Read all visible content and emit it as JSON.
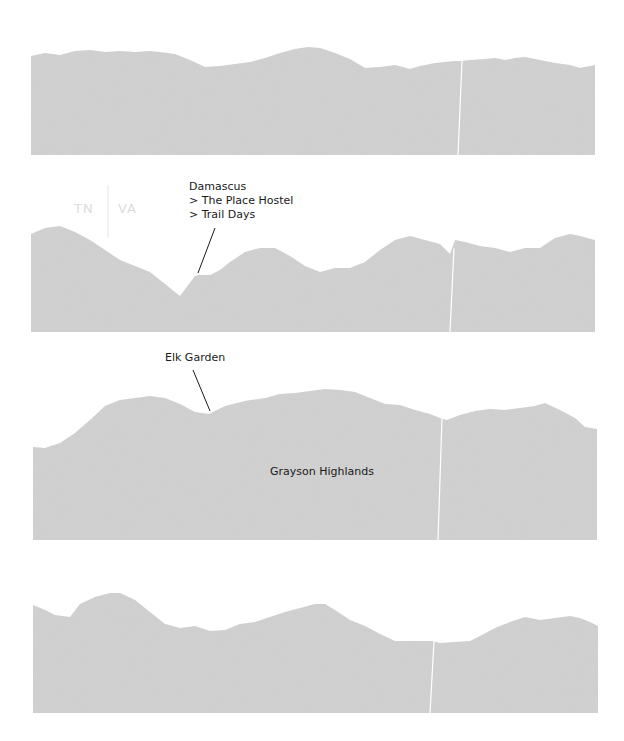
{
  "chart_data": {
    "type": "area",
    "title": "",
    "xlabel": "",
    "ylabel": "",
    "grid": false,
    "legend": null,
    "fill_color": "#cdcdcd",
    "panels": [
      {
        "id": "panel-1",
        "bounds": {
          "x0": 31,
          "x1": 595,
          "bottom": 155
        },
        "profile": [
          [
            31,
            56
          ],
          [
            45,
            53
          ],
          [
            60,
            55
          ],
          [
            75,
            51
          ],
          [
            90,
            50
          ],
          [
            105,
            52
          ],
          [
            120,
            51
          ],
          [
            135,
            52
          ],
          [
            150,
            51
          ],
          [
            160,
            52
          ],
          [
            175,
            54
          ],
          [
            190,
            60
          ],
          [
            205,
            67
          ],
          [
            220,
            66
          ],
          [
            235,
            64
          ],
          [
            250,
            62
          ],
          [
            265,
            58
          ],
          [
            280,
            53
          ],
          [
            295,
            49
          ],
          [
            308,
            47
          ],
          [
            320,
            48
          ],
          [
            335,
            53
          ],
          [
            350,
            59
          ],
          [
            365,
            68
          ],
          [
            380,
            67
          ],
          [
            395,
            65
          ],
          [
            410,
            69
          ],
          [
            420,
            66
          ],
          [
            435,
            63
          ],
          [
            445,
            62
          ],
          [
            455,
            61
          ],
          [
            462,
            61
          ],
          [
            470,
            60
          ],
          [
            485,
            59
          ],
          [
            495,
            58
          ],
          [
            505,
            60
          ],
          [
            515,
            58
          ],
          [
            525,
            57
          ],
          [
            540,
            60
          ],
          [
            555,
            63
          ],
          [
            570,
            65
          ],
          [
            580,
            68
          ],
          [
            595,
            65
          ]
        ],
        "divider_x": 460,
        "annotations": []
      },
      {
        "id": "panel-2",
        "bounds": {
          "x0": 31,
          "x1": 595,
          "bottom": 332
        },
        "profile": [
          [
            31,
            234
          ],
          [
            45,
            228
          ],
          [
            60,
            226
          ],
          [
            75,
            232
          ],
          [
            90,
            240
          ],
          [
            105,
            250
          ],
          [
            120,
            260
          ],
          [
            135,
            266
          ],
          [
            150,
            272
          ],
          [
            165,
            284
          ],
          [
            180,
            296
          ],
          [
            195,
            276
          ],
          [
            200,
            275
          ],
          [
            210,
            275
          ],
          [
            220,
            270
          ],
          [
            230,
            262
          ],
          [
            245,
            252
          ],
          [
            260,
            248
          ],
          [
            275,
            248
          ],
          [
            290,
            256
          ],
          [
            305,
            266
          ],
          [
            320,
            272
          ],
          [
            335,
            268
          ],
          [
            350,
            268
          ],
          [
            365,
            262
          ],
          [
            380,
            250
          ],
          [
            395,
            240
          ],
          [
            410,
            236
          ],
          [
            425,
            240
          ],
          [
            440,
            244
          ],
          [
            450,
            254
          ],
          [
            455,
            240
          ],
          [
            465,
            242
          ],
          [
            480,
            246
          ],
          [
            495,
            248
          ],
          [
            510,
            252
          ],
          [
            525,
            248
          ],
          [
            540,
            248
          ],
          [
            555,
            238
          ],
          [
            570,
            234
          ],
          [
            580,
            236
          ],
          [
            595,
            240
          ]
        ],
        "divider_x": 452,
        "annotations": [
          {
            "text_lines": [
              "Damascus",
              "> The Place Hostel",
              "> Trail Days"
            ],
            "text_x": 189,
            "text_y": 190,
            "leader_from": [
              215,
              228
            ],
            "leader_to": [
              198,
              273
            ]
          }
        ],
        "state_labels": [
          {
            "text": "TN",
            "x": 74,
            "y": 213
          },
          {
            "text": "VA",
            "x": 118,
            "y": 213
          }
        ],
        "state_divider_x": 108
      },
      {
        "id": "panel-3",
        "bounds": {
          "x0": 33,
          "x1": 597,
          "bottom": 540
        },
        "profile": [
          [
            33,
            447
          ],
          [
            45,
            448
          ],
          [
            60,
            443
          ],
          [
            75,
            433
          ],
          [
            90,
            420
          ],
          [
            105,
            406
          ],
          [
            120,
            400
          ],
          [
            135,
            398
          ],
          [
            150,
            396
          ],
          [
            165,
            398
          ],
          [
            180,
            404
          ],
          [
            195,
            412
          ],
          [
            209,
            414
          ],
          [
            225,
            406
          ],
          [
            245,
            401
          ],
          [
            265,
            398
          ],
          [
            280,
            394
          ],
          [
            295,
            393
          ],
          [
            310,
            391
          ],
          [
            325,
            389
          ],
          [
            340,
            390
          ],
          [
            355,
            392
          ],
          [
            370,
            398
          ],
          [
            385,
            404
          ],
          [
            400,
            405
          ],
          [
            415,
            410
          ],
          [
            430,
            414
          ],
          [
            440,
            418
          ],
          [
            447,
            420
          ],
          [
            460,
            415
          ],
          [
            475,
            411
          ],
          [
            490,
            409
          ],
          [
            505,
            410
          ],
          [
            520,
            408
          ],
          [
            535,
            406
          ],
          [
            545,
            403
          ],
          [
            560,
            410
          ],
          [
            575,
            418
          ],
          [
            585,
            427
          ],
          [
            597,
            429
          ]
        ],
        "divider_x": 440,
        "annotations": [
          {
            "text_lines": [
              "Elk Garden"
            ],
            "text_x": 165,
            "text_y": 361,
            "leader_from": [
              193,
              370
            ],
            "leader_to": [
              210,
              411
            ]
          },
          {
            "text_lines": [
              "Grayson Highlands"
            ],
            "text_x": 270,
            "text_y": 475,
            "leader_from": null,
            "leader_to": null
          }
        ]
      },
      {
        "id": "panel-4",
        "bounds": {
          "x0": 33,
          "x1": 598,
          "bottom": 713
        },
        "profile": [
          [
            33,
            605
          ],
          [
            45,
            610
          ],
          [
            55,
            615
          ],
          [
            70,
            617
          ],
          [
            80,
            604
          ],
          [
            95,
            597
          ],
          [
            110,
            593
          ],
          [
            120,
            593
          ],
          [
            135,
            600
          ],
          [
            150,
            612
          ],
          [
            165,
            624
          ],
          [
            180,
            628
          ],
          [
            195,
            626
          ],
          [
            210,
            631
          ],
          [
            225,
            630
          ],
          [
            240,
            624
          ],
          [
            255,
            622
          ],
          [
            270,
            617
          ],
          [
            285,
            612
          ],
          [
            300,
            608
          ],
          [
            315,
            604
          ],
          [
            325,
            604
          ],
          [
            335,
            610
          ],
          [
            350,
            620
          ],
          [
            365,
            626
          ],
          [
            380,
            634
          ],
          [
            395,
            641
          ],
          [
            410,
            641
          ],
          [
            425,
            641
          ],
          [
            432,
            641
          ],
          [
            440,
            643
          ],
          [
            455,
            642
          ],
          [
            470,
            641
          ],
          [
            480,
            636
          ],
          [
            495,
            628
          ],
          [
            510,
            622
          ],
          [
            525,
            617
          ],
          [
            540,
            620
          ],
          [
            555,
            618
          ],
          [
            570,
            616
          ],
          [
            580,
            618
          ],
          [
            590,
            622
          ],
          [
            598,
            626
          ]
        ],
        "divider_x": 432,
        "annotations": []
      }
    ]
  }
}
